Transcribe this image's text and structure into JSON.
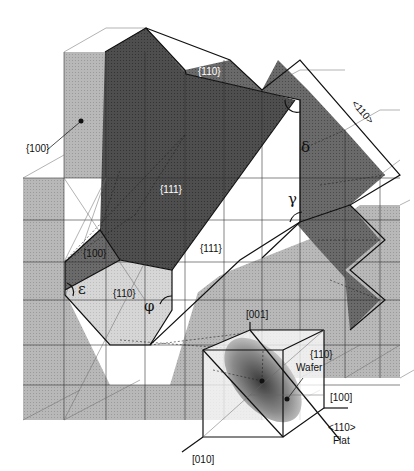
{
  "figure": {
    "colors": {
      "background": "#ffffff",
      "plane_100": "#b5b5b5",
      "plane_110_light": "#d2d2d2",
      "plane_111_dark": "#555555",
      "plane_110_top": "#6b6b6b",
      "wafer_ellipse": "#777777",
      "lines": "#222222"
    },
    "plane_labels": {
      "p100_outer": "{100}",
      "p110_top": "{110}",
      "p111_top": "{111}",
      "p100_inner": "{100}",
      "p111_side": "{111}",
      "p110_floor": "{110}"
    },
    "direction_labels": {
      "dir_110_edge": "<110>"
    },
    "angles": {
      "delta": "δ",
      "gamma": "γ",
      "epsilon": "ε",
      "phi": "φ"
    },
    "inset": {
      "axis_001": "[001]",
      "axis_100": "[100]",
      "axis_010": "[010]",
      "wafer_label_line1": "{110}",
      "wafer_label_line2": "Wafer",
      "flat_label_line1": "<110>",
      "flat_label_line2": "Flat"
    }
  }
}
